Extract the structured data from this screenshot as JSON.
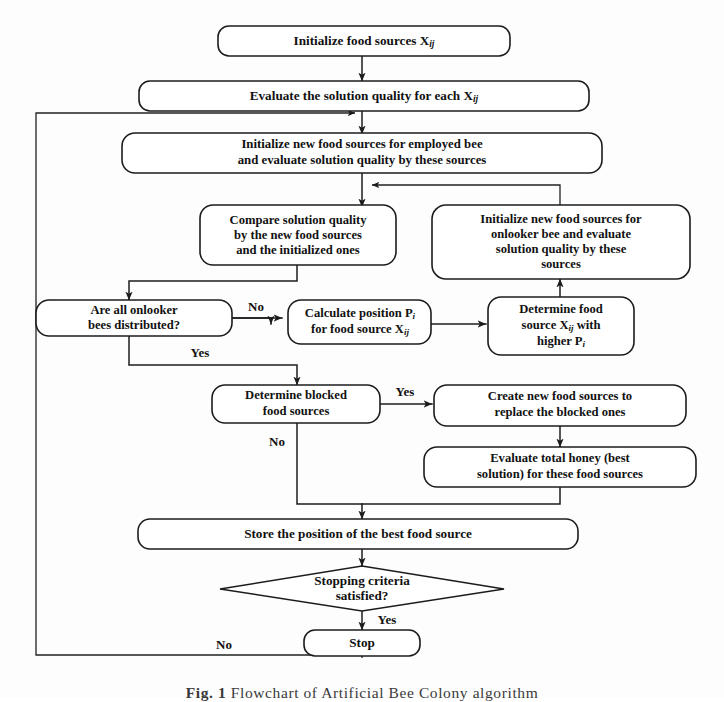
{
  "figure": {
    "caption_label": "Fig. 1",
    "caption_text": "Flowchart of Artificial Bee Colony algorithm",
    "background": "#fdfdfd",
    "ink_color": "#1c1c1c"
  },
  "nodes": {
    "initialize_food_sources": {
      "line1": "Initialize food sources X",
      "sub1": "ij"
    },
    "evaluate_solution_quality": {
      "line1": "Evaluate the solution quality for each X",
      "sub1": "ij"
    },
    "employed_bee": {
      "line1": "Initialize new food sources for employed bee",
      "line2": "and evaluate solution quality by these sources"
    },
    "compare_solution": {
      "line1": "Compare solution quality",
      "line2": "by the new food sources",
      "line3": "and the initialized ones"
    },
    "onlooker_bee": {
      "line1": "Initialize new food sources for",
      "line2": "onlooker bee and evaluate",
      "line3": "solution quality by these",
      "line4": "sources"
    },
    "onlooker_distributed": {
      "line1": "Are all onlooker",
      "line2": "bees distributed?"
    },
    "calculate_position": {
      "line1a": "Calculate position P",
      "sub1": "i",
      "line2a": "for food source X",
      "sub2": "ij"
    },
    "determine_food_source": {
      "line1": "Determine food",
      "line2a": "source X",
      "sub2": "ij",
      "line2b": " with",
      "line3a": "higher P",
      "sub3": "i"
    },
    "determine_blocked": {
      "line1": "Determine blocked",
      "line2": "food sources"
    },
    "create_new_sources": {
      "line1": "Create new food sources to",
      "line2": "replace the blocked ones"
    },
    "evaluate_total_honey": {
      "line1": "Evaluate total honey (best",
      "line2": "solution) for these food sources"
    },
    "store_best_position": {
      "line1": "Store the position of the best food source"
    },
    "stopping_criteria": {
      "line1": "Stopping criteria",
      "line2": "satisfied?"
    },
    "stop": {
      "line1": "Stop"
    }
  },
  "edge_labels": {
    "onlooker_no": "No",
    "onlooker_yes": "Yes",
    "blocked_yes": "Yes",
    "blocked_no": "No",
    "stopping_yes": "Yes",
    "stopping_no": "No"
  }
}
